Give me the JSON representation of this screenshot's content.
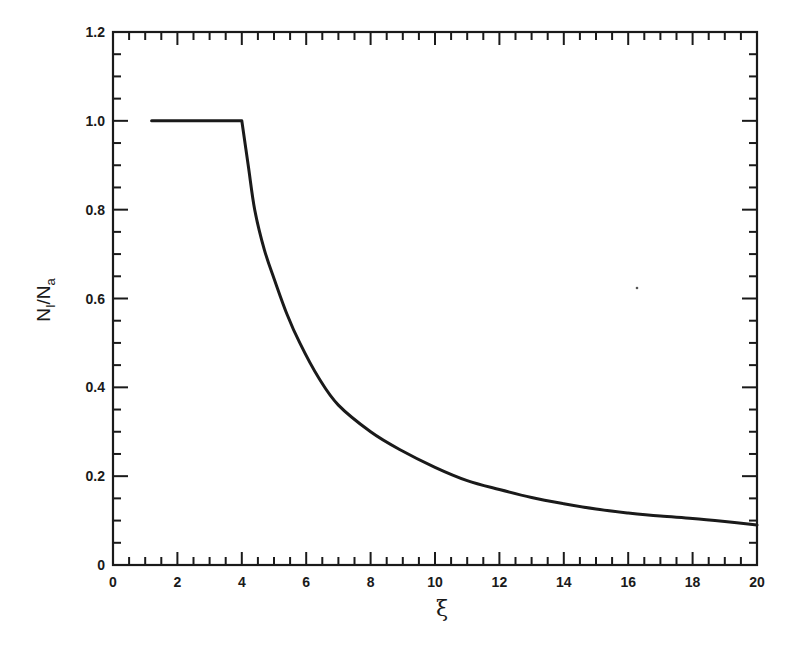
{
  "chart_data": {
    "type": "line",
    "title": "",
    "xlabel": "ξ",
    "ylabel": "N_I/N_a",
    "ylabel_parts": {
      "main1": "N",
      "sub1": "I",
      "slash": "/",
      "main2": "N",
      "sub2": "a"
    },
    "xlim": [
      0,
      20
    ],
    "ylim": [
      0,
      1.2
    ],
    "x_ticks": [
      0,
      2,
      4,
      6,
      8,
      10,
      12,
      14,
      16,
      18,
      20
    ],
    "x_tick_labels": [
      "0",
      "2",
      "4",
      "6",
      "8",
      "10",
      "12",
      "14",
      "16",
      "18",
      "20"
    ],
    "x_minor_step": 0.5,
    "y_ticks": [
      0,
      0.2,
      0.4,
      0.6,
      0.8,
      1.0,
      1.2
    ],
    "y_tick_labels": [
      "0",
      "0.2",
      "0.4",
      "0.6",
      "0.8",
      "1.0",
      "1.2"
    ],
    "y_minor_step": 0.05,
    "grid": false,
    "legend": null,
    "series": [
      {
        "name": "N_I/N_a",
        "color": "#1a1a1a",
        "x": [
          1.2,
          2.0,
          3.0,
          4.0,
          4.2,
          4.4,
          4.7,
          5.0,
          5.4,
          5.8,
          6.4,
          7.0,
          8.0,
          8.9,
          10.0,
          11.0,
          12.0,
          13.0,
          14.0,
          15.0,
          16.0,
          17.0,
          18.0,
          19.0,
          20.0
        ],
        "y": [
          1.0,
          1.0,
          1.0,
          1.0,
          0.9,
          0.8,
          0.71,
          0.645,
          0.565,
          0.5,
          0.42,
          0.36,
          0.3,
          0.26,
          0.22,
          0.19,
          0.17,
          0.152,
          0.138,
          0.126,
          0.117,
          0.11,
          0.105,
          0.098,
          0.09
        ]
      }
    ]
  },
  "layout": {
    "plot_left": 113,
    "plot_top": 32,
    "plot_right": 757,
    "plot_bottom": 565
  }
}
